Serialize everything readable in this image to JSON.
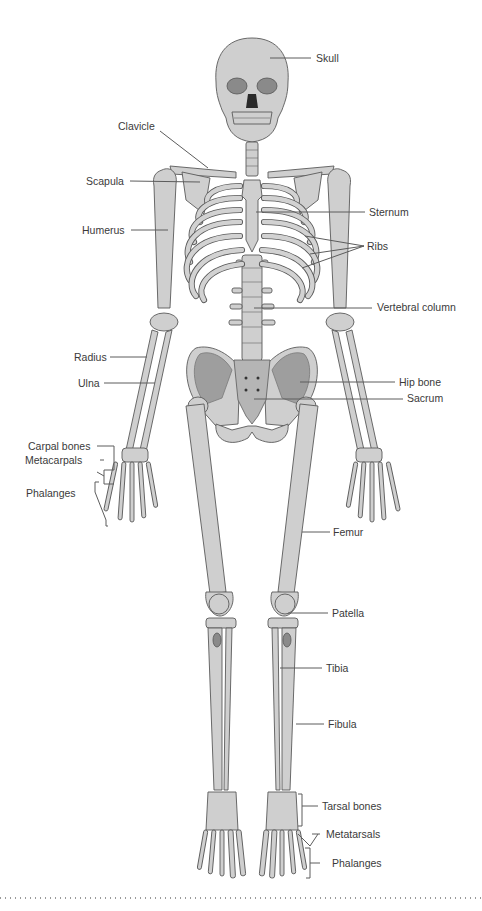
{
  "diagram": {
    "colors": {
      "bone_fill": "#cfcfcf",
      "bone_outline": "#5a5a5a",
      "hip_shadow": "#8a8a8a",
      "label_text": "#3a3a3a",
      "leader_line": "#5c5c5c",
      "background": "#ffffff"
    },
    "labels": {
      "skull": "Skull",
      "clavicle": "Clavicle",
      "scapula": "Scapula",
      "sternum": "Sternum",
      "humerus": "Humerus",
      "ribs": "Ribs",
      "vertebral_column": "Vertebral column",
      "radius": "Radius",
      "ulna": "Ulna",
      "hip_bone": "Hip bone",
      "sacrum": "Sacrum",
      "carpal_bones": "Carpal bones",
      "metacarpals": "Metacarpals",
      "hand_phalanges": "Phalanges",
      "femur": "Femur",
      "patella": "Patella",
      "tibia": "Tibia",
      "fibula": "Fibula",
      "tarsal_bones": "Tarsal bones",
      "metatarsals": "Metatarsals",
      "foot_phalanges": "Phalanges"
    }
  }
}
